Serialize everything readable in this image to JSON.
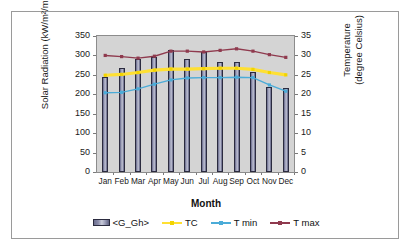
{
  "chart_data": {
    "type": "bar",
    "title": "",
    "categories": [
      "Jan",
      "Feb",
      "Mar",
      "Apr",
      "May",
      "Jun",
      "Jul",
      "Aug",
      "Sep",
      "Oct",
      "Nov",
      "Dec"
    ],
    "xlabel": "Month",
    "ylabel": "Solar Radiation (kW/m²/month)",
    "ylabel_secondary": "Temperature (degree Celsius)",
    "ylim": [
      0,
      350
    ],
    "ylim_secondary": [
      0,
      35
    ],
    "yticks": [
      0,
      50,
      100,
      150,
      200,
      250,
      300,
      350
    ],
    "yticks_secondary": [
      0,
      5,
      10,
      15,
      20,
      25,
      30,
      35
    ],
    "grid": false,
    "legend_position": "bottom",
    "series": [
      {
        "name": "<G_Gh>",
        "kind": "bar",
        "axis": "left",
        "unit": "kW/m²/month",
        "color": "#8a8caa",
        "values": [
          245,
          268,
          292,
          297,
          315,
          292,
          310,
          283,
          282,
          257,
          219,
          216
        ]
      },
      {
        "name": "TC",
        "kind": "line",
        "axis": "right",
        "unit": "degree Celsius",
        "color": "#ffe033",
        "values": [
          24.9,
          25.1,
          25.6,
          26.2,
          26.5,
          26.5,
          26.6,
          26.7,
          26.7,
          26.4,
          25.6,
          25.0
        ]
      },
      {
        "name": "T min",
        "kind": "line",
        "axis": "right",
        "unit": "degree Celsius",
        "color": "#4bacd8",
        "values": [
          20.4,
          20.5,
          21.4,
          22.6,
          23.7,
          24.2,
          24.3,
          24.3,
          24.4,
          24.3,
          22.4,
          20.8
        ]
      },
      {
        "name": "T max",
        "kind": "line",
        "axis": "right",
        "unit": "degree Celsius",
        "color": "#8f3a4e",
        "values": [
          30.0,
          29.7,
          29.3,
          29.8,
          31.1,
          31.1,
          30.9,
          31.3,
          31.7,
          31.1,
          30.2,
          29.5
        ]
      }
    ]
  },
  "legend": {
    "items": [
      {
        "label": "<G_Gh>",
        "marker": "bar-swatch"
      },
      {
        "label": "TC",
        "marker": "line-swatch"
      },
      {
        "label": "T min",
        "marker": "line-swatch"
      },
      {
        "label": "T max",
        "marker": "line-swatch"
      }
    ]
  },
  "axes": {
    "left_title": "Solar Radiation (kW/m²/month)",
    "right_title_line1": "Temperature",
    "right_title_line2": "(degree Celsius)",
    "x_title": "Month"
  },
  "colors": {
    "bar": "#8a8caa",
    "bar_edge": "#2b2b3f",
    "tc": "#ffe033",
    "tmin": "#4bacd8",
    "tmax": "#8f3a4e",
    "plot_background": "#d4d4d4",
    "frame": "#9a9a9a"
  }
}
